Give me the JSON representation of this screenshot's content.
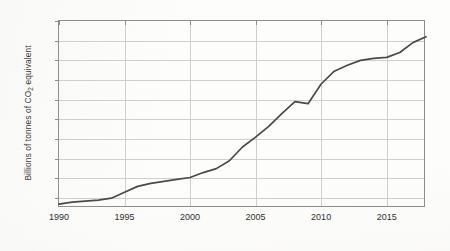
{
  "chart_data": {
    "type": "line",
    "title": "",
    "subtitle": "",
    "xlabel": "",
    "ylabel": "Billions of tonnes of CO2 equivalent",
    "ylabel_parts": {
      "pre": "Billions of tonnes of CO",
      "sub": "2",
      "post": " equivalent"
    },
    "xlim": [
      1990,
      2018
    ],
    "ylim": [
      29,
      48
    ],
    "xticks": [
      1990,
      1995,
      2000,
      2005,
      2010,
      2015
    ],
    "xtick_labels": [
      "1990",
      "1995",
      "2000",
      "2005",
      "2010",
      "2015"
    ],
    "yticks": [
      30,
      32,
      34,
      36,
      38,
      40,
      42,
      44,
      46,
      48
    ],
    "ytick_labels": [
      "30",
      "32",
      "34",
      "36",
      "38",
      "40",
      "42",
      "44",
      "46",
      "48"
    ],
    "grid": "both",
    "legend": "none",
    "line_color": "#4a4a4a",
    "grid_color": "#cfcfcf",
    "axis_color": "#8e8e8e",
    "series": [
      {
        "name": "Global greenhouse gas emissions",
        "x": [
          1990,
          1991,
          1992,
          1993,
          1994,
          1995,
          1996,
          1997,
          1998,
          1999,
          2000,
          2001,
          2002,
          2003,
          2004,
          2005,
          2006,
          2007,
          2008,
          2009,
          2010,
          2011,
          2012,
          2013,
          2014,
          2015,
          2016,
          2017,
          2018
        ],
        "values": [
          29.4,
          29.6,
          29.7,
          29.8,
          30.0,
          30.6,
          31.2,
          31.5,
          31.7,
          31.9,
          32.1,
          32.6,
          33.0,
          33.8,
          35.2,
          36.2,
          37.3,
          38.6,
          39.8,
          39.6,
          41.6,
          42.9,
          43.5,
          44.0,
          44.2,
          44.3,
          44.8,
          45.8,
          46.4
        ]
      }
    ]
  }
}
